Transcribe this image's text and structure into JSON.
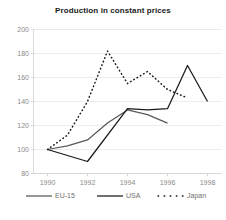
{
  "chart_data": {
    "type": "line",
    "title": "Production in constant prices",
    "xlabel": "",
    "ylabel": "",
    "x": [
      1990,
      1991,
      1992,
      1993,
      1994,
      1995,
      1996,
      1997,
      1998
    ],
    "xlim": [
      1989.3,
      1998.7
    ],
    "ylim": [
      80,
      200
    ],
    "xticks": [
      "1990",
      "1992",
      "1994",
      "1996",
      "1998"
    ],
    "xtick_values": [
      1990,
      1992,
      1994,
      1996,
      1998
    ],
    "yticks": [
      "80",
      "100",
      "120",
      "140",
      "160",
      "180",
      "200"
    ],
    "ytick_values": [
      80,
      100,
      120,
      140,
      160,
      180,
      200
    ],
    "grid": true,
    "legend_position": "bottom",
    "series": [
      {
        "name": "EU-15",
        "style": "solid",
        "color": "#595959",
        "x": [
          1990,
          1991,
          1992,
          1993,
          1994,
          1995,
          1996
        ],
        "values": [
          100,
          103,
          108,
          122,
          133,
          129,
          122
        ]
      },
      {
        "name": "USA",
        "style": "solid",
        "color": "#1a1a1a",
        "x": [
          1990,
          1992,
          1994,
          1995,
          1996,
          1997,
          1998
        ],
        "values": [
          100,
          90,
          134,
          133,
          134,
          170,
          140
        ]
      },
      {
        "name": "Japan",
        "style": "dotted",
        "color": "#1a1a1a",
        "x": [
          1990,
          1991,
          1992,
          1993,
          1994,
          1995,
          1996,
          1997
        ],
        "values": [
          100,
          112,
          140,
          182,
          155,
          165,
          150,
          143
        ]
      }
    ]
  },
  "legend": {
    "items": [
      {
        "label": "EU-15",
        "style": "solid",
        "color": "#595959"
      },
      {
        "label": "USA",
        "style": "solid",
        "color": "#1a1a1a"
      },
      {
        "label": "Japan",
        "style": "dotted",
        "color": "#1a1a1a"
      }
    ]
  }
}
